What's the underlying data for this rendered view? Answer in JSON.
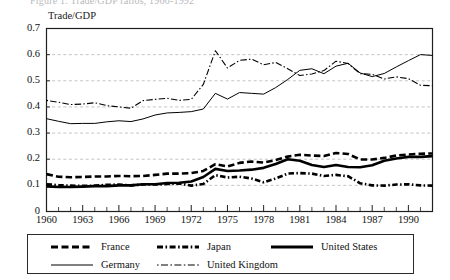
{
  "figure": {
    "clipped_header": "Figure 1.  Trade/GDP ratios, 1960-1992",
    "axis_title": "Trade/GDP"
  },
  "chart_data": {
    "type": "line",
    "title": "Trade/GDP",
    "xlabel": "",
    "ylabel": "Trade/GDP",
    "xlim": [
      1960,
      1992
    ],
    "ylim": [
      0,
      0.7
    ],
    "ytick_step": 0.1,
    "grid": true,
    "grid_style": "dashed-gray-horizontal",
    "xtick_interval": 1,
    "xtick_label_interval": 3,
    "legend_position": "below-plot",
    "ytick_labels": [
      "0",
      "0.1",
      "0.2",
      "0.3",
      "0.4",
      "0.5",
      "0.6",
      "0.7"
    ],
    "ytick_values": [
      0,
      0.1,
      0.2,
      0.3,
      0.4,
      0.5,
      0.6,
      0.7
    ],
    "xtick_labels": [
      "1960",
      "1963",
      "1966",
      "1969",
      "1972",
      "1975",
      "1978",
      "1981",
      "1984",
      "1987",
      "1990"
    ],
    "xtick_values": [
      1960,
      1963,
      1966,
      1969,
      1972,
      1975,
      1978,
      1981,
      1984,
      1987,
      1990
    ],
    "x": [
      1960,
      1961,
      1962,
      1963,
      1964,
      1965,
      1966,
      1967,
      1968,
      1969,
      1970,
      1971,
      1972,
      1973,
      1974,
      1975,
      1976,
      1977,
      1978,
      1979,
      1980,
      1981,
      1982,
      1983,
      1984,
      1985,
      1986,
      1987,
      1988,
      1989,
      1990,
      1991,
      1992
    ],
    "series": [
      {
        "name": "France",
        "style": "thick-dashed",
        "color": "#000000",
        "values": [
          0.143,
          0.133,
          0.131,
          0.132,
          0.134,
          0.134,
          0.136,
          0.135,
          0.136,
          0.14,
          0.145,
          0.145,
          0.147,
          0.155,
          0.181,
          0.172,
          0.186,
          0.191,
          0.187,
          0.197,
          0.21,
          0.217,
          0.214,
          0.212,
          0.224,
          0.22,
          0.199,
          0.199,
          0.205,
          0.214,
          0.218,
          0.221,
          0.222
        ]
      },
      {
        "name": "Japan",
        "style": "thick-dash-dot",
        "color": "#000000",
        "values": [
          0.104,
          0.101,
          0.099,
          0.098,
          0.099,
          0.102,
          0.103,
          0.1,
          0.103,
          0.103,
          0.105,
          0.107,
          0.099,
          0.105,
          0.139,
          0.13,
          0.133,
          0.126,
          0.112,
          0.126,
          0.145,
          0.147,
          0.145,
          0.136,
          0.14,
          0.135,
          0.108,
          0.1,
          0.099,
          0.103,
          0.104,
          0.1,
          0.099
        ]
      },
      {
        "name": "United States",
        "style": "thick-solid",
        "color": "#000000",
        "values": [
          0.096,
          0.094,
          0.094,
          0.095,
          0.097,
          0.097,
          0.1,
          0.1,
          0.104,
          0.104,
          0.109,
          0.11,
          0.115,
          0.132,
          0.163,
          0.155,
          0.157,
          0.16,
          0.167,
          0.182,
          0.2,
          0.194,
          0.178,
          0.17,
          0.178,
          0.17,
          0.169,
          0.177,
          0.194,
          0.203,
          0.209,
          0.209,
          0.212
        ]
      },
      {
        "name": "Germany",
        "style": "thin-solid",
        "color": "#000000",
        "values": [
          0.355,
          0.345,
          0.336,
          0.337,
          0.337,
          0.343,
          0.347,
          0.344,
          0.354,
          0.369,
          0.377,
          0.379,
          0.382,
          0.392,
          0.452,
          0.43,
          0.455,
          0.452,
          0.449,
          0.474,
          0.505,
          0.54,
          0.546,
          0.527,
          0.556,
          0.567,
          0.53,
          0.516,
          0.528,
          0.553,
          0.577,
          0.6,
          0.597
        ]
      },
      {
        "name": "United Kingdom",
        "style": "thin-dash-dot",
        "color": "#000000",
        "values": [
          0.425,
          0.418,
          0.409,
          0.411,
          0.416,
          0.405,
          0.4,
          0.395,
          0.424,
          0.429,
          0.433,
          0.425,
          0.429,
          0.486,
          0.615,
          0.549,
          0.578,
          0.583,
          0.561,
          0.57,
          0.546,
          0.52,
          0.526,
          0.539,
          0.575,
          0.566,
          0.527,
          0.525,
          0.507,
          0.515,
          0.508,
          0.483,
          0.481
        ]
      }
    ]
  },
  "legend": {
    "entries": [
      {
        "label": "France",
        "style": "thick-dashed"
      },
      {
        "label": "Japan",
        "style": "thick-dash-dot"
      },
      {
        "label": "United States",
        "style": "thick-solid"
      },
      {
        "label": "Germany",
        "style": "thin-solid"
      },
      {
        "label": "United Kingdom",
        "style": "thin-dash-dot"
      }
    ]
  }
}
